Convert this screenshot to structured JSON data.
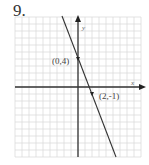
{
  "problem": {
    "number": "9."
  },
  "chart_data": {
    "type": "line",
    "title": "",
    "xlabel": "x",
    "ylabel": "y",
    "xlim": [
      -9,
      9
    ],
    "ylim": [
      -10,
      10
    ],
    "grid": true,
    "series": [
      {
        "name": "y = -5/2 x + 4",
        "slope": -2.5,
        "intercept": 4,
        "points": [
          {
            "x": 0,
            "y": 4,
            "label": "(0,4)"
          },
          {
            "x": 2,
            "y": -1,
            "label": "(2,-1)"
          }
        ]
      }
    ],
    "annotations": [
      "(0,4)",
      "(2,-1)"
    ]
  },
  "labels": {
    "p1": "(0,4)",
    "p2": "(2,-1)",
    "x_axis": "x",
    "y_axis": "y"
  },
  "colors": {
    "grid": "#d8d8d8",
    "axis": "#333333",
    "line": "#333333"
  }
}
